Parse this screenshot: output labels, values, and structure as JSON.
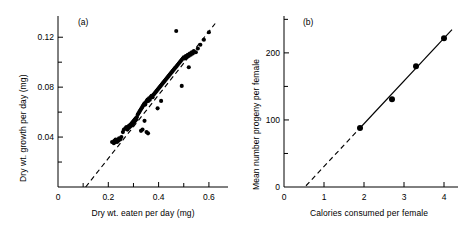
{
  "figure": {
    "panel_count": 2,
    "background": "#ffffff",
    "ink": "#000000"
  },
  "chart_data": [
    {
      "id": "panel-a",
      "type": "scatter",
      "tag": "(a)",
      "title": "",
      "xlabel": "Dry wt. eaten per day (mg)",
      "ylabel": "Dry wt. growth per day (mg)",
      "xlim": [
        0,
        0.66
      ],
      "ylim": [
        0,
        0.137
      ],
      "xticks_major": [
        0,
        0.2,
        0.4,
        0.6
      ],
      "xticklabels_major": [
        "0",
        "0.2",
        "0.4",
        "0.6"
      ],
      "xticks_minor": [
        0.1,
        0.3,
        0.5
      ],
      "yticks_major": [
        0.04,
        0.08,
        0.12
      ],
      "yticklabels_major": [
        "0.04",
        "0.08",
        "0.12"
      ],
      "yticks_minor": [
        0.02,
        0.06,
        0.1
      ],
      "grid": false,
      "legend": "none",
      "marker": "filled-circle",
      "marker_color": "#000000",
      "fit_line": {
        "style": "dashed",
        "x_start": 0.11,
        "y_start": 0.0,
        "x_end": 0.625,
        "y_end": 0.131,
        "note": "dashed least-squares line extrapolated to x-axis"
      },
      "x": [
        0.215,
        0.222,
        0.224,
        0.228,
        0.229,
        0.232,
        0.235,
        0.238,
        0.24,
        0.243,
        0.247,
        0.252,
        0.258,
        0.262,
        0.268,
        0.272,
        0.276,
        0.279,
        0.282,
        0.285,
        0.288,
        0.291,
        0.293,
        0.295,
        0.297,
        0.299,
        0.301,
        0.303,
        0.305,
        0.307,
        0.309,
        0.311,
        0.314,
        0.317,
        0.32,
        0.323,
        0.326,
        0.329,
        0.332,
        0.335,
        0.338,
        0.341,
        0.344,
        0.347,
        0.35,
        0.353,
        0.356,
        0.359,
        0.362,
        0.365,
        0.368,
        0.372,
        0.376,
        0.38,
        0.384,
        0.388,
        0.392,
        0.396,
        0.4,
        0.404,
        0.408,
        0.412,
        0.416,
        0.42,
        0.424,
        0.428,
        0.432,
        0.436,
        0.44,
        0.444,
        0.448,
        0.452,
        0.456,
        0.46,
        0.464,
        0.468,
        0.472,
        0.476,
        0.48,
        0.484,
        0.488,
        0.492,
        0.496,
        0.5,
        0.504,
        0.508,
        0.512,
        0.516,
        0.52,
        0.524,
        0.528,
        0.532,
        0.536,
        0.54,
        0.548,
        0.556,
        0.566,
        0.58,
        0.6,
        0.33,
        0.336,
        0.344,
        0.352,
        0.358,
        0.396,
        0.41,
        0.47,
        0.492,
        0.52
      ],
      "y": [
        0.036,
        0.035,
        0.037,
        0.036,
        0.038,
        0.037,
        0.036,
        0.038,
        0.037,
        0.039,
        0.038,
        0.04,
        0.044,
        0.046,
        0.047,
        0.048,
        0.046,
        0.047,
        0.049,
        0.048,
        0.05,
        0.049,
        0.051,
        0.05,
        0.052,
        0.051,
        0.053,
        0.052,
        0.054,
        0.053,
        0.055,
        0.054,
        0.056,
        0.058,
        0.059,
        0.06,
        0.061,
        0.062,
        0.063,
        0.064,
        0.065,
        0.066,
        0.067,
        0.066,
        0.068,
        0.069,
        0.07,
        0.069,
        0.071,
        0.07,
        0.072,
        0.073,
        0.072,
        0.074,
        0.075,
        0.076,
        0.077,
        0.078,
        0.079,
        0.08,
        0.081,
        0.082,
        0.083,
        0.084,
        0.085,
        0.086,
        0.087,
        0.088,
        0.089,
        0.09,
        0.091,
        0.092,
        0.093,
        0.094,
        0.095,
        0.096,
        0.097,
        0.098,
        0.099,
        0.1,
        0.101,
        0.102,
        0.103,
        0.104,
        0.103,
        0.105,
        0.104,
        0.106,
        0.105,
        0.107,
        0.106,
        0.108,
        0.107,
        0.109,
        0.108,
        0.111,
        0.114,
        0.118,
        0.124,
        0.045,
        0.046,
        0.053,
        0.044,
        0.043,
        0.063,
        0.069,
        0.125,
        0.081,
        0.096
      ],
      "n_points": 109,
      "outliers_note": "one high point near (0.47, 0.125); a few low points near x 0.33-0.36"
    },
    {
      "id": "panel-b",
      "type": "scatter",
      "tag": "(b)",
      "title": "",
      "xlabel": "Calories consumed per female",
      "ylabel": "Mean number progeny per female",
      "xlim": [
        0,
        4.25
      ],
      "ylim": [
        0,
        255
      ],
      "xticks_major": [
        0,
        1,
        2,
        3,
        4
      ],
      "xticklabels_major": [
        "0",
        "1",
        "2",
        "3",
        "4"
      ],
      "xticks_minor": [],
      "yticks_major": [
        0,
        100,
        200
      ],
      "yticklabels_major": [
        "0",
        "100",
        "200"
      ],
      "yticks_minor": [
        50,
        150,
        250
      ],
      "grid": false,
      "legend": "none",
      "marker": "filled-circle",
      "marker_color": "#000000",
      "fit_line": {
        "style": "solid-with-dashed-extrapolation",
        "solid_from_x": 1.9,
        "solid_to_x": 4.2,
        "dashed_from_x": 0.55,
        "dashed_to_x": 1.9,
        "x_intercept": 0.55
      },
      "x": [
        1.9,
        2.7,
        3.3,
        4.0
      ],
      "y": [
        88,
        131,
        180,
        222
      ],
      "n_points": 4
    }
  ]
}
